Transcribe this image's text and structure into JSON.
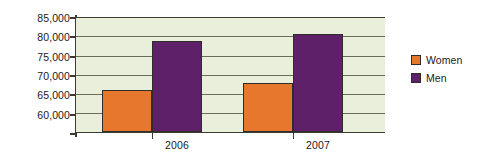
{
  "chart_data": {
    "type": "bar",
    "title": "",
    "subtitle": "",
    "xlabel": "",
    "ylabel": "",
    "categories": [
      "2006",
      "2007"
    ],
    "series": [
      {
        "name": "Women",
        "color": "#E8772E",
        "values": [
          69300,
          70800
        ]
      },
      {
        "name": "Men",
        "color": "#5E2069",
        "values": [
          80000,
          81400
        ]
      }
    ],
    "ylim": [
      60000,
      85000
    ],
    "ytick_values": [
      60000,
      65000,
      70000,
      75000,
      80000,
      85000
    ],
    "ytick_labels": [
      "60,000",
      "65,000",
      "70,000",
      "75,000",
      "80,000",
      "85,000"
    ],
    "grid": true,
    "grid_axis": "y",
    "legend_position": "right",
    "legend_entries": [
      "Women",
      "Men"
    ],
    "annotations": [],
    "plot_background": "#E9EFDA",
    "axis_color": "#3B3B33",
    "gridline_color": "#6C6C5C"
  },
  "legend": {
    "items": [
      {
        "label": "Women",
        "swatch": "women-color-swatch"
      },
      {
        "label": "Men",
        "swatch": "men-color-swatch"
      }
    ]
  },
  "axes": {
    "y_labels": [
      "85,000",
      "80,000",
      "75,000",
      "70,000",
      "65,000",
      "60,000"
    ],
    "x_labels": [
      "2006",
      "2007"
    ]
  }
}
